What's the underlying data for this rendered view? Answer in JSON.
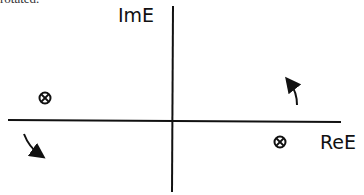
{
  "caption": "rotated.",
  "diagram": {
    "x_axis_label": "ReE",
    "y_axis_label": "ImE",
    "points": [
      {
        "name": "pole-left",
        "symbol": "⊗",
        "quadrant": "upper-left"
      },
      {
        "name": "pole-right",
        "symbol": "⊗",
        "quadrant": "lower-right"
      }
    ],
    "arrows": [
      {
        "name": "rotation-arrow-right",
        "direction": "up-left"
      },
      {
        "name": "rotation-arrow-left",
        "direction": "down-right"
      }
    ]
  }
}
